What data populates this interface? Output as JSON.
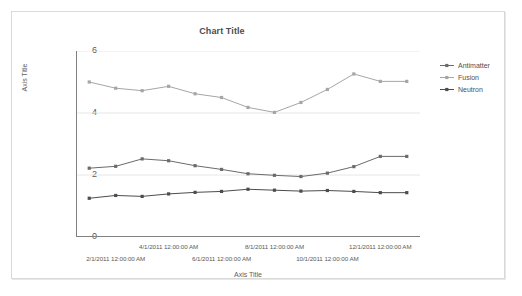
{
  "frame": {
    "border_color": "#d9d9d9",
    "background": "#ffffff"
  },
  "chart_data": {
    "type": "line",
    "title": "Chart Title",
    "xlabel": "Axis Title",
    "ylabel": "Axis Title",
    "ylim": [
      0,
      6
    ],
    "y_ticks": [
      0,
      2,
      4,
      6
    ],
    "grid": true,
    "grid_color": "#e6e6e6",
    "legend_position": "right",
    "x": [
      "1/1/2011 12:00:00 AM",
      "2/1/2011 12:00:00 AM",
      "3/1/2011 12:00:00 AM",
      "4/1/2011 12:00:00 AM",
      "5/1/2011 12:00:00 AM",
      "6/1/2011 12:00:00 AM",
      "7/1/2011 12:00:00 AM",
      "8/1/2011 12:00:00 AM",
      "9/1/2011 12:00:00 AM",
      "10/1/2011 12:00:00 AM",
      "11/1/2011 12:00:00 AM",
      "12/1/2011 12:00:00 AM",
      "1/1/2012 12:00:00 AM"
    ],
    "x_tick_labels": [
      {
        "index": 1,
        "text": "2/1/2011 12:00:00 AM",
        "row": 2
      },
      {
        "index": 3,
        "text": "4/1/2011 12:00:00 AM",
        "row": 1
      },
      {
        "index": 5,
        "text": "6/1/2011 12:00:00 AM",
        "row": 2
      },
      {
        "index": 7,
        "text": "8/1/2011 12:00:00 AM",
        "row": 1
      },
      {
        "index": 9,
        "text": "10/1/2011 12:00:00 AM",
        "row": 2
      },
      {
        "index": 11,
        "text": "12/1/2011 12:00:00 AM",
        "row": 1
      }
    ],
    "series": [
      {
        "name": "Antimatter",
        "color": "#6b6b6b",
        "marker": "square",
        "values": [
          2.22,
          2.28,
          2.52,
          2.46,
          2.3,
          2.18,
          2.04,
          1.99,
          1.95,
          2.06,
          2.27,
          2.6,
          2.6
        ]
      },
      {
        "name": "Fusion",
        "color": "#a6a6a6",
        "marker": "square",
        "values": [
          5.0,
          4.8,
          4.72,
          4.86,
          4.62,
          4.5,
          4.18,
          4.02,
          4.34,
          4.76,
          5.26,
          5.02,
          5.02
        ]
      },
      {
        "name": "Neutron",
        "color": "#4d4d4d",
        "marker": "square",
        "values": [
          1.25,
          1.34,
          1.31,
          1.39,
          1.44,
          1.47,
          1.54,
          1.51,
          1.48,
          1.5,
          1.47,
          1.43,
          1.43
        ]
      }
    ]
  },
  "legend": {
    "items": [
      {
        "label": "Antimatter",
        "color": "#6b6b6b"
      },
      {
        "label": "Fusion",
        "color": "#a6a6a6"
      },
      {
        "label": "Neutron",
        "color": "#4d4d4d"
      }
    ]
  }
}
